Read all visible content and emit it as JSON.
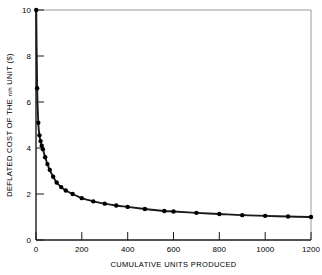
{
  "chart_data": {
    "type": "line",
    "title": "",
    "subtitle": "",
    "xlabel": "CUMULATIVE UNITS PRODUCED",
    "ylabel": "DEFLATED COST OF THE nth UNIT ($)",
    "ylabel_parts": {
      "lead": "DEFLATED COST OF THE ",
      "small": "nth",
      "tail": " UNIT ($)"
    },
    "xlim": [
      0,
      1200
    ],
    "ylim": [
      0,
      10
    ],
    "xticks": [
      0,
      200,
      400,
      600,
      800,
      1000,
      1200
    ],
    "xtick_labels": [
      "0",
      "200",
      "400",
      "600",
      "800",
      "1000",
      "1200"
    ],
    "yticks": [
      0,
      2,
      4,
      6,
      8,
      10
    ],
    "ytick_labels": [
      "0",
      "2",
      "4",
      "6",
      "8",
      "10"
    ],
    "grid": false,
    "legend": "none",
    "marker": "filled-circle",
    "marker_size": 2.2,
    "line_color": "#1a1a1a",
    "marker_color": "#000000",
    "axis_color": "#1a1a1a",
    "frame_color": "#9a9a9a",
    "series": [
      {
        "name": "deflated unit cost",
        "x": [
          1,
          5,
          10,
          15,
          20,
          25,
          30,
          40,
          50,
          60,
          75,
          90,
          110,
          130,
          160,
          200,
          250,
          300,
          350,
          400,
          475,
          560,
          600,
          700,
          800,
          900,
          1000,
          1100,
          1200
        ],
        "y": [
          10.0,
          6.6,
          5.1,
          4.55,
          4.3,
          4.1,
          3.95,
          3.6,
          3.3,
          3.05,
          2.75,
          2.5,
          2.3,
          2.15,
          2.0,
          1.82,
          1.68,
          1.58,
          1.5,
          1.44,
          1.35,
          1.26,
          1.24,
          1.18,
          1.13,
          1.08,
          1.05,
          1.02,
          1.0
        ]
      }
    ]
  }
}
